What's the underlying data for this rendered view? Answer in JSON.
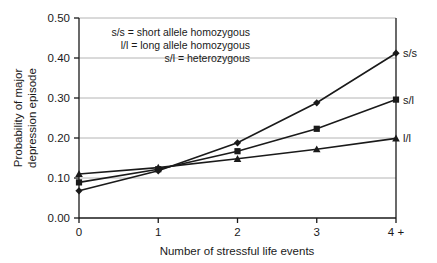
{
  "chart_data": {
    "type": "line",
    "title": "",
    "xlabel": "Number of stressful life events",
    "ylabel": "Probability of major depression episode",
    "ylabel_line1": "Probability of major",
    "ylabel_line2": "depression episode",
    "categories": [
      "0",
      "1",
      "2",
      "3",
      "4 +"
    ],
    "xticklabels": [
      "0",
      "1",
      "2",
      "3",
      "4 +"
    ],
    "yticklabels": [
      "0.00",
      "0.10",
      "0.20",
      "0.30",
      "0.40",
      "0.50"
    ],
    "yticks": [
      0.0,
      0.1,
      0.2,
      0.3,
      0.4,
      0.5
    ],
    "ylim": [
      0.0,
      0.5
    ],
    "xlim": [
      0,
      4
    ],
    "grid": "horizontal",
    "legend_position": "upper-left-inside",
    "series": [
      {
        "name": "s/s",
        "marker": "diamond",
        "end_label": "s/s",
        "values": [
          0.068,
          0.118,
          0.188,
          0.288,
          0.412
        ]
      },
      {
        "name": "s/l",
        "marker": "square",
        "end_label": "s/l",
        "values": [
          0.089,
          0.122,
          0.167,
          0.223,
          0.296
        ]
      },
      {
        "name": "l/l",
        "marker": "triangle",
        "end_label": "l/l",
        "values": [
          0.11,
          0.126,
          0.148,
          0.172,
          0.199
        ]
      }
    ],
    "legend_entries": [
      "s/s = short allele homozygous",
      "l/l = long allele homozygous",
      "s/l = heterozygous"
    ],
    "colors": {
      "line": "#1a1a1a",
      "grid": "#b4b4b4",
      "axis": "#1a1a1a",
      "background": "#ffffff"
    }
  }
}
